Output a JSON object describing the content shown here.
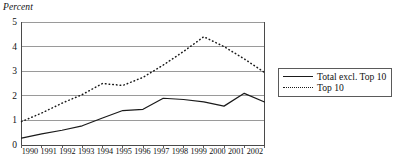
{
  "chart_data": {
    "type": "line",
    "title": "",
    "xlabel": "",
    "ylabel": "Percent",
    "ylim": [
      0,
      5
    ],
    "yticks": [
      0,
      1,
      2,
      3,
      4,
      5
    ],
    "grid": true,
    "legend_position": "right-outside",
    "categories": [
      "1990",
      "1991",
      "1992",
      "1993",
      "1994",
      "1995",
      "1996",
      "1997",
      "1998",
      "1999",
      "2000",
      "2001",
      "2002"
    ],
    "series": [
      {
        "name": "Total excl. Top 10",
        "style": "solid",
        "color": "#1a1a1a",
        "values": [
          0.28,
          0.45,
          0.6,
          0.78,
          1.1,
          1.4,
          1.45,
          1.9,
          1.85,
          1.75,
          1.58,
          2.1,
          1.75
        ]
      },
      {
        "name": "Top 10",
        "style": "dotted",
        "color": "#1a1a1a",
        "values": [
          0.95,
          1.3,
          1.7,
          2.05,
          2.5,
          2.42,
          2.75,
          3.25,
          3.8,
          4.4,
          4.0,
          3.5,
          2.95
        ]
      }
    ]
  },
  "axes": {
    "y_title": "Percent",
    "y_tick_labels": [
      "5",
      "4",
      "3",
      "2",
      "1",
      "0"
    ],
    "x_tick_labels": [
      "1990",
      "1991",
      "1992",
      "1993",
      "1994",
      "1995",
      "1996",
      "1997",
      "1998",
      "1999",
      "2000",
      "2001",
      "2002"
    ]
  },
  "legend": {
    "entries": [
      {
        "label": "Total excl. Top 10",
        "style": "solid"
      },
      {
        "label": "Top 10",
        "style": "dotted"
      }
    ]
  },
  "colors": {
    "line": "#1a1a1a",
    "grid": "#8f8f8f",
    "axis": "#4a4a4a",
    "background": "#ffffff"
  }
}
